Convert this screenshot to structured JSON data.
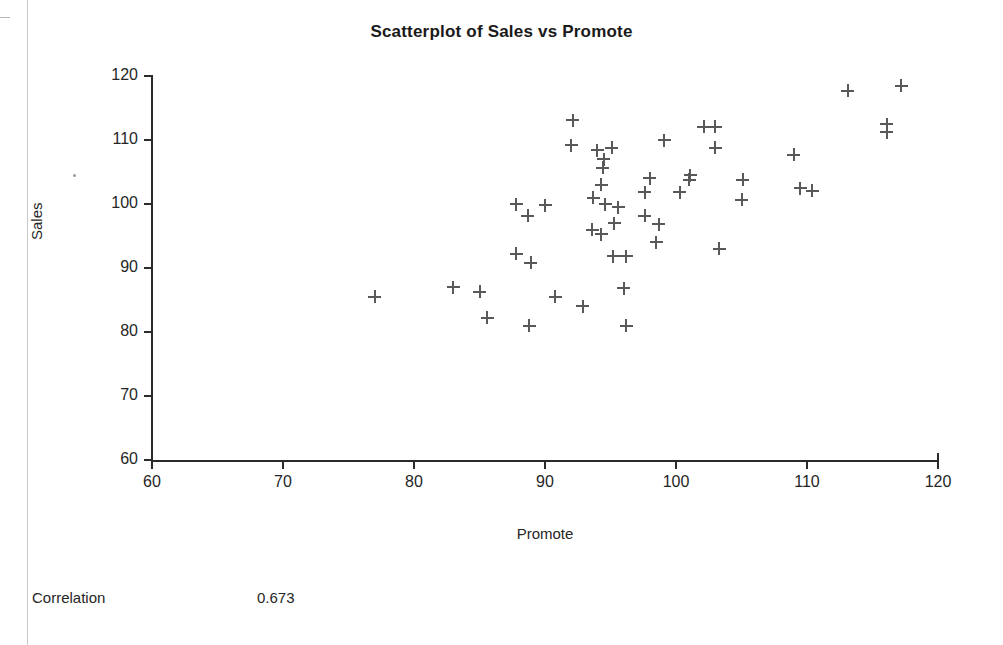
{
  "document": {
    "correlation_label": "Correlation",
    "correlation_value": "0.673"
  },
  "chart_data": {
    "type": "scatter",
    "title": "Scatterplot of Sales vs Promote",
    "xlabel": "Promote",
    "ylabel": "Sales",
    "xlim": [
      60,
      120
    ],
    "ylim": [
      60,
      120
    ],
    "xticks": [
      60,
      70,
      80,
      90,
      100,
      110,
      120
    ],
    "yticks": [
      60,
      70,
      80,
      90,
      100,
      110,
      120
    ],
    "grid": false,
    "legend": null,
    "marker": "plus",
    "marker_color": "#595959",
    "correlation": 0.673,
    "n_points": 54,
    "points": [
      {
        "x": 77.0,
        "y": 85.5
      },
      {
        "x": 83.0,
        "y": 87.0
      },
      {
        "x": 85.0,
        "y": 86.3
      },
      {
        "x": 85.6,
        "y": 82.2
      },
      {
        "x": 87.8,
        "y": 100.0
      },
      {
        "x": 88.7,
        "y": 98.2
      },
      {
        "x": 90.0,
        "y": 99.8
      },
      {
        "x": 87.8,
        "y": 92.2
      },
      {
        "x": 88.9,
        "y": 90.8
      },
      {
        "x": 88.8,
        "y": 81.0
      },
      {
        "x": 90.8,
        "y": 85.5
      },
      {
        "x": 92.1,
        "y": 113.1
      },
      {
        "x": 92.9,
        "y": 84.0
      },
      {
        "x": 92.0,
        "y": 109.2
      },
      {
        "x": 94.0,
        "y": 108.4
      },
      {
        "x": 94.5,
        "y": 107.0
      },
      {
        "x": 94.4,
        "y": 105.7
      },
      {
        "x": 95.1,
        "y": 108.8
      },
      {
        "x": 94.3,
        "y": 103.0
      },
      {
        "x": 93.7,
        "y": 101.0
      },
      {
        "x": 94.6,
        "y": 100.0
      },
      {
        "x": 95.6,
        "y": 99.5
      },
      {
        "x": 93.6,
        "y": 96.0
      },
      {
        "x": 94.3,
        "y": 95.3
      },
      {
        "x": 95.3,
        "y": 97.0
      },
      {
        "x": 95.2,
        "y": 91.8
      },
      {
        "x": 96.2,
        "y": 91.8
      },
      {
        "x": 96.0,
        "y": 86.8
      },
      {
        "x": 96.2,
        "y": 81.0
      },
      {
        "x": 98.0,
        "y": 104.0
      },
      {
        "x": 97.6,
        "y": 101.8
      },
      {
        "x": 97.6,
        "y": 98.2
      },
      {
        "x": 98.7,
        "y": 96.8
      },
      {
        "x": 98.5,
        "y": 94.0
      },
      {
        "x": 99.1,
        "y": 110.0
      },
      {
        "x": 100.3,
        "y": 101.8
      },
      {
        "x": 101.1,
        "y": 104.5
      },
      {
        "x": 101.0,
        "y": 103.8
      },
      {
        "x": 102.1,
        "y": 112.1
      },
      {
        "x": 103.0,
        "y": 112.1
      },
      {
        "x": 103.0,
        "y": 108.8
      },
      {
        "x": 103.3,
        "y": 93.0
      },
      {
        "x": 105.1,
        "y": 103.8
      },
      {
        "x": 105.0,
        "y": 100.7
      },
      {
        "x": 109.0,
        "y": 107.7
      },
      {
        "x": 109.5,
        "y": 102.5
      },
      {
        "x": 110.4,
        "y": 102.1
      },
      {
        "x": 113.1,
        "y": 117.7
      },
      {
        "x": 116.1,
        "y": 112.5
      },
      {
        "x": 116.1,
        "y": 111.2
      },
      {
        "x": 117.2,
        "y": 118.5
      }
    ]
  }
}
